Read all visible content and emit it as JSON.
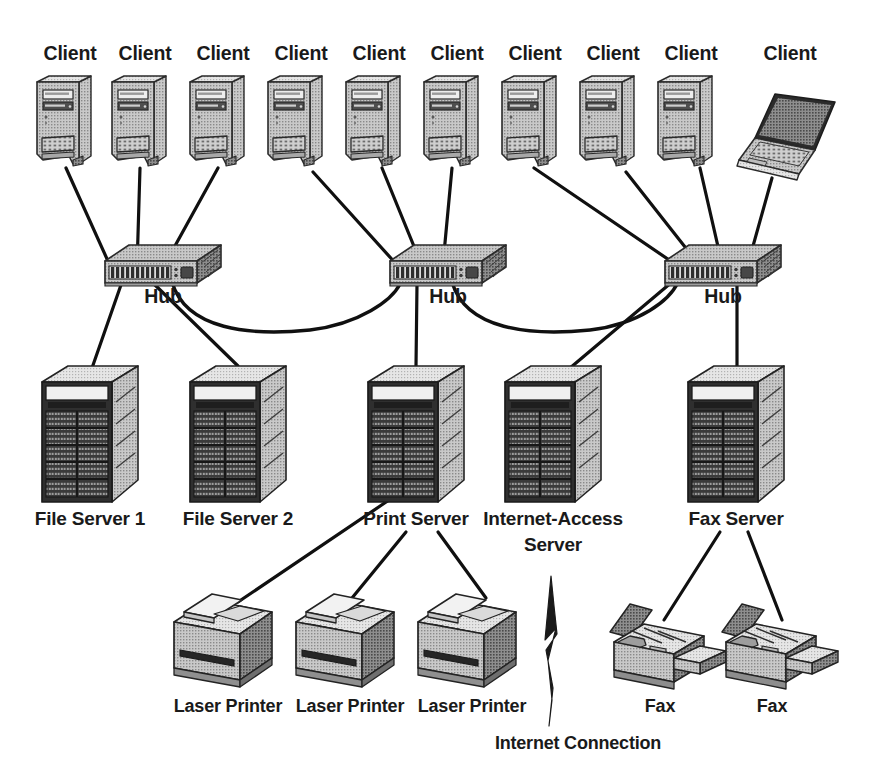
{
  "diagram": {
    "background": "#ffffff",
    "ink": "#101010"
  },
  "labels": {
    "client": "Client",
    "hub": "Hub",
    "file_server_1": "File Server 1",
    "file_server_2": "File Server 2",
    "print_server": "Print Server",
    "internet_access_server_line1": "Internet-Access",
    "internet_access_server_line2": "Server",
    "fax_server": "Fax Server",
    "laser_printer": "Laser Printer",
    "fax": "Fax",
    "internet_connection": "Internet Connection"
  },
  "clients": [
    {
      "id": "client-1",
      "label": "Client",
      "type": "desktop-tower",
      "x": 70,
      "label_y": 60,
      "icon_x": 33,
      "icon_y": 76,
      "hub": "hub-1"
    },
    {
      "id": "client-2",
      "label": "Client",
      "type": "desktop-tower",
      "x": 145,
      "label_y": 60,
      "icon_x": 108,
      "icon_y": 76,
      "hub": "hub-1"
    },
    {
      "id": "client-3",
      "label": "Client",
      "type": "desktop-tower",
      "x": 223,
      "label_y": 60,
      "icon_x": 186,
      "icon_y": 76,
      "hub": "hub-1"
    },
    {
      "id": "client-4",
      "label": "Client",
      "type": "desktop-tower",
      "x": 301,
      "label_y": 60,
      "icon_x": 264,
      "icon_y": 76,
      "hub": "hub-2"
    },
    {
      "id": "client-5",
      "label": "Client",
      "type": "desktop-tower",
      "x": 379,
      "label_y": 60,
      "icon_x": 342,
      "icon_y": 76,
      "hub": "hub-2"
    },
    {
      "id": "client-6",
      "label": "Client",
      "type": "desktop-tower",
      "x": 457,
      "label_y": 60,
      "icon_x": 420,
      "icon_y": 76,
      "hub": "hub-2"
    },
    {
      "id": "client-7",
      "label": "Client",
      "type": "desktop-tower",
      "x": 535,
      "label_y": 60,
      "icon_x": 498,
      "icon_y": 76,
      "hub": "hub-3"
    },
    {
      "id": "client-8",
      "label": "Client",
      "type": "desktop-tower",
      "x": 613,
      "label_y": 60,
      "icon_x": 576,
      "icon_y": 76,
      "hub": "hub-3"
    },
    {
      "id": "client-9",
      "label": "Client",
      "type": "desktop-tower",
      "x": 691,
      "label_y": 60,
      "icon_x": 654,
      "icon_y": 76,
      "hub": "hub-3"
    },
    {
      "id": "client-10",
      "label": "Client",
      "type": "laptop",
      "x": 790,
      "label_y": 60,
      "icon_x": 737,
      "icon_y": 88,
      "hub": "hub-3"
    }
  ],
  "hubs": [
    {
      "id": "hub-1",
      "label": "Hub",
      "x": 105,
      "y": 245,
      "label_x": 163,
      "label_y": 303,
      "ports": 13
    },
    {
      "id": "hub-2",
      "label": "Hub",
      "x": 390,
      "y": 245,
      "label_x": 448,
      "label_y": 303,
      "ports": 13
    },
    {
      "id": "hub-3",
      "label": "Hub",
      "x": 665,
      "y": 245,
      "label_x": 723,
      "label_y": 303,
      "ports": 13
    }
  ],
  "servers": [
    {
      "id": "file-server-1",
      "label": "File Server 1",
      "x": 42,
      "y": 362,
      "label_x": 90,
      "label_y": 525,
      "hub": "hub-1"
    },
    {
      "id": "file-server-2",
      "label": "File Server 2",
      "x": 190,
      "y": 362,
      "label_x": 238,
      "label_y": 525,
      "hub": "hub-1"
    },
    {
      "id": "print-server",
      "label": "Print Server",
      "x": 368,
      "y": 362,
      "label_x": 416,
      "label_y": 525,
      "hub": "hub-2"
    },
    {
      "id": "internet-server",
      "label": "Internet-Access",
      "x": 505,
      "y": 362,
      "label_x": 553,
      "label_y": 525,
      "hub": "hub-3",
      "label2": "Server",
      "label2_y": 551
    },
    {
      "id": "fax-server",
      "label": "Fax Server",
      "x": 688,
      "y": 362,
      "label_x": 736,
      "label_y": 525,
      "hub": "hub-3"
    }
  ],
  "printers": [
    {
      "id": "laser-printer-1",
      "label": "Laser Printer",
      "x": 168,
      "y": 588,
      "label_x": 228,
      "label_y": 712,
      "source": "print-server"
    },
    {
      "id": "laser-printer-2",
      "label": "Laser Printer",
      "x": 290,
      "y": 588,
      "label_x": 350,
      "label_y": 712,
      "source": "print-server"
    },
    {
      "id": "laser-printer-3",
      "label": "Laser Printer",
      "x": 412,
      "y": 588,
      "label_x": 472,
      "label_y": 712,
      "source": "print-server"
    }
  ],
  "faxes": [
    {
      "id": "fax-1",
      "label": "Fax",
      "x": 600,
      "y": 600,
      "label_x": 660,
      "label_y": 712,
      "source": "fax-server"
    },
    {
      "id": "fax-2",
      "label": "Fax",
      "x": 712,
      "y": 600,
      "label_x": 772,
      "label_y": 712,
      "source": "fax-server"
    }
  ],
  "internet": {
    "label": "Internet Connection",
    "label_x": 578,
    "label_y": 749,
    "bolt_top_x": 549,
    "bolt_top_y": 576,
    "bolt_bottom_y": 726,
    "source": "internet-server"
  },
  "trunk_links": [
    {
      "from": "hub-1",
      "to": "hub-2"
    },
    {
      "from": "hub-2",
      "to": "hub-3"
    }
  ]
}
